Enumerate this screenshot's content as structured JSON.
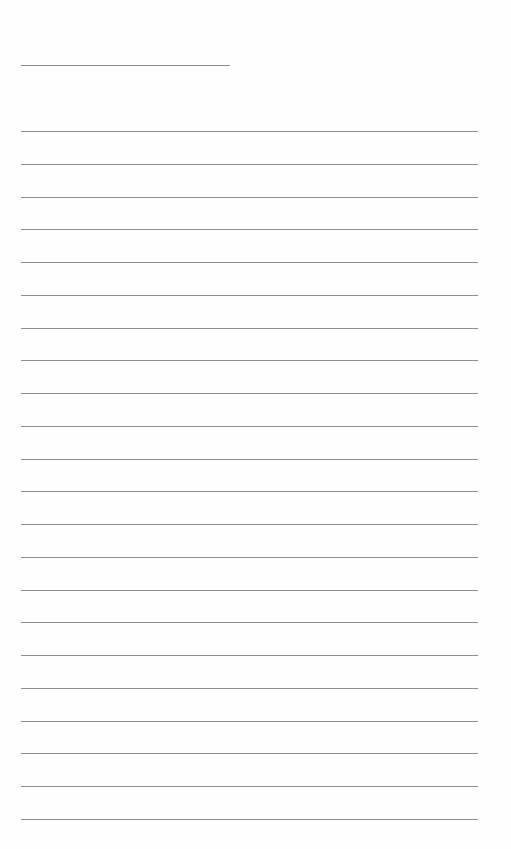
{
  "document": {
    "type": "blank-lined-sheet",
    "header_line": {
      "label": ""
    },
    "lines": [
      "",
      "",
      "",
      "",
      "",
      "",
      "",
      "",
      "",
      "",
      "",
      "",
      "",
      "",
      "",
      "",
      "",
      "",
      "",
      "",
      "",
      ""
    ],
    "line_color": "#8f8f8f",
    "background_color": "#fefefe"
  }
}
